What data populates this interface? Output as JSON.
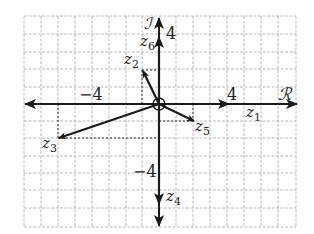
{
  "diagram": {
    "axes": {
      "real_label": "ℛ",
      "imag_label": "ℐ",
      "tick_labels": {
        "x_neg": "−4",
        "x_pos": "4",
        "y_pos": "4",
        "y_neg": "−4"
      },
      "x_range": [
        -8,
        8
      ],
      "y_range": [
        -7,
        5
      ]
    },
    "vectors": [
      {
        "name": "z1",
        "label": "z",
        "sub": "1",
        "re": 4,
        "im": 0
      },
      {
        "name": "z2",
        "label": "z",
        "sub": "2",
        "re": -1,
        "im": 2
      },
      {
        "name": "z3",
        "label": "z",
        "sub": "3",
        "re": -6,
        "im": -2
      },
      {
        "name": "z4",
        "label": "z",
        "sub": "4",
        "re": 0,
        "im": -6
      },
      {
        "name": "z5",
        "label": "z",
        "sub": "5",
        "re": 2,
        "im": -1
      },
      {
        "name": "z6",
        "label": "z",
        "sub": "6",
        "re": 0,
        "im": 4
      }
    ],
    "colors": {
      "grid": "#b8b8b8",
      "axis": "#1a1a1a",
      "vector": "#1a1a1a",
      "guide": "#333333"
    }
  }
}
